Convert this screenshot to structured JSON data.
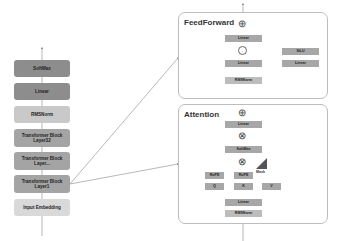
{
  "left_stack": {
    "items": [
      {
        "label": "SoftMax",
        "shade": "dark"
      },
      {
        "label": "Linear",
        "shade": "dark"
      },
      {
        "label": "RMSNorm",
        "shade": "light"
      },
      {
        "label": "Transformer Block\nLayer32",
        "line1": "Transformer Block",
        "line2": "Layer32",
        "shade": "mid"
      },
      {
        "label": "Transformer Block\nLayer...",
        "line1": "Transformer Block",
        "line2": "Layer...",
        "shade": "mid"
      },
      {
        "label": "Transformer Block\nLayer1",
        "line1": "Transformer Block",
        "line2": "Layer1",
        "shade": "mid"
      },
      {
        "label": "Input Embedding",
        "shade": "lighter"
      }
    ]
  },
  "feedforward": {
    "title": "FeedForward",
    "blocks": {
      "linear_top": "Linear",
      "multiply": "·",
      "silu": "SiLU",
      "linear_left": "Linear",
      "linear_right": "Linear",
      "rmsnorm": "RMSNorm"
    },
    "add_symbol": "⊕"
  },
  "attention": {
    "title": "Attention",
    "blocks": {
      "linear_top": "Linear",
      "softmax": "SoftMax",
      "rope_q": "RoPE",
      "rope_k": "RoPE",
      "q": "Q",
      "k": "K",
      "v": "V",
      "mask": "Mask",
      "linear_bottom": "Linear",
      "rmsnorm": "RMSNorm"
    },
    "add_symbol": "⊕",
    "matmul_symbol": "⊗"
  },
  "colors": {
    "box_dark": "#8d8d8d",
    "box_mid": "#a4a4a4",
    "box_light": "#c9c9c9",
    "panel_border": "#bdbdbd",
    "line": "#888888"
  }
}
